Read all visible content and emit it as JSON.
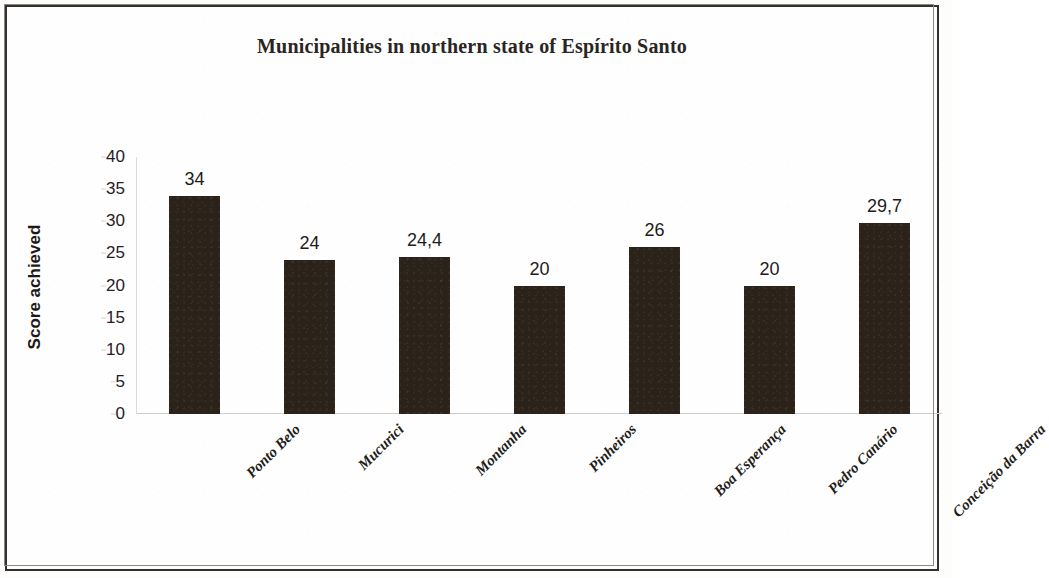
{
  "chart_data": {
    "type": "bar",
    "title": "Municipalities in northern state of Espírito Santo",
    "xlabel": "",
    "ylabel": "Score achieved",
    "categories": [
      "Ponto Belo",
      "Mucurici",
      "Montanha",
      "Pinheiros",
      "Boa Esperança",
      "Pedro Canário",
      "Conceição da Barra"
    ],
    "values": [
      34,
      24,
      24.4,
      20,
      26,
      20,
      29.7
    ],
    "value_labels": [
      "34",
      "24",
      "24,4",
      "20",
      "26",
      "20",
      "29,7"
    ],
    "ylim": [
      0,
      40
    ],
    "yticks": [
      0,
      5,
      10,
      15,
      20,
      25,
      30,
      35,
      40
    ],
    "ytick_labels": [
      "0",
      "5",
      "10",
      "15",
      "20",
      "25",
      "30",
      "35",
      "40"
    ],
    "grid": false,
    "legend": null,
    "bar_color": "#2b2219",
    "axis_color": "#cfcbc6",
    "text_color": "#211c19",
    "background_color": "#fefefe",
    "label_rotation_deg": -45
  }
}
